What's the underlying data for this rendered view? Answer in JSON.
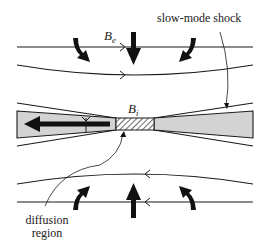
{
  "diagram": {
    "labels": {
      "slow_mode_shock": "slow-mode shock",
      "diffusion_region_line1": "diffusion",
      "diffusion_region_line2": "region",
      "external_field": "B",
      "external_field_sub": "e",
      "internal_field": "B",
      "internal_field_sub": "i"
    },
    "colors": {
      "line": "#1a1a1a",
      "outflow_fill": "#d3d3d3",
      "arrow": "#111111",
      "background": "#ffffff"
    },
    "elements": {
      "field_lines_top": [
        "straight field line with rightward arrowhead",
        "curved field line with rightward arrowhead"
      ],
      "field_lines_bottom": [
        "curved field line with leftward arrowhead",
        "straight field line with leftward arrowhead"
      ],
      "inflow_arrows_top": [
        "curved-left",
        "straight-down",
        "curved-right"
      ],
      "inflow_arrows_bottom": [
        "curved-left",
        "straight-up",
        "curved-right"
      ],
      "outflow_arrow": "leftward jet in left shocked region",
      "diffusion_region": "hatched rectangle at center"
    }
  }
}
